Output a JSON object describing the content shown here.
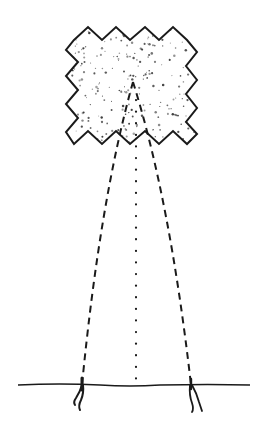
{
  "illustration": {
    "subject": "hand-drawn kite sketch",
    "background_color": "#ffffff",
    "ink_color": "#1a1a1a",
    "elements": {
      "kite": {
        "shape": "zigzag-edged square",
        "fill": "stippled dots"
      },
      "strings": {
        "count": 2,
        "style": "dashed"
      },
      "center_line": {
        "style": "dotted"
      },
      "ground": {
        "style": "solid line"
      },
      "stakes": {
        "count": 2
      }
    }
  }
}
